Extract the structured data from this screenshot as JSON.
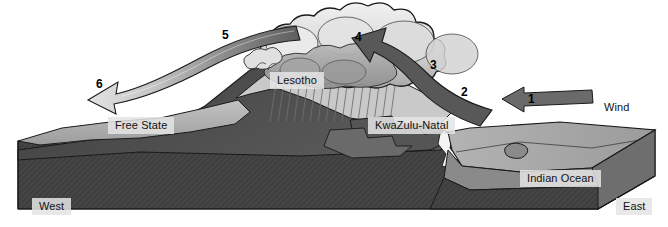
{
  "diagram": {
    "type": "cross-section-block-diagram"
  },
  "colors": {
    "cloud_light": "#e8e8e8",
    "cloud_mid": "#c8c8c8",
    "cloud_dark": "#9a9a9a",
    "arrow_dark": "#555555",
    "arrow_light": "#d9d9d9",
    "mountain_dark": "#4a4a4a",
    "mountain_mid": "#8d8d8d",
    "plateau_light": "#b4b4b4",
    "ocean": "#9f9f9f",
    "bedrock": "#3d3d3d",
    "outline": "#1a1a1a",
    "label_bg": "#e4e4e4"
  },
  "region_labels": [
    {
      "id": "lesotho",
      "text": "Lesotho",
      "x": 270,
      "y": 72,
      "chip": true
    },
    {
      "id": "free-state",
      "text": "Free State",
      "x": 108,
      "y": 117,
      "chip": true
    },
    {
      "id": "kwazulu-natal",
      "text": "KwaZulu-Natal",
      "x": 368,
      "y": 117,
      "chip": true
    },
    {
      "id": "indian-ocean",
      "text": "Indian Ocean",
      "x": 520,
      "y": 170,
      "chip": true
    },
    {
      "id": "west",
      "text": "West",
      "x": 32,
      "y": 198,
      "chip": true
    },
    {
      "id": "east",
      "text": "East",
      "x": 616,
      "y": 198,
      "chip": true
    },
    {
      "id": "wind",
      "text": "Wind",
      "x": 604,
      "y": 101,
      "chip": false
    }
  ],
  "step_numbers": [
    {
      "id": "step-1",
      "text": "1",
      "x": 528,
      "y": 93,
      "description": "Moist wind blows in from the Indian Ocean"
    },
    {
      "id": "step-2",
      "text": "2",
      "x": 461,
      "y": 86,
      "description": "Air is forced to rise up the escarpment"
    },
    {
      "id": "step-3",
      "text": "3",
      "x": 430,
      "y": 59,
      "description": "Air cools, condenses and forms cloud"
    },
    {
      "id": "step-4",
      "text": "4",
      "x": 355,
      "y": 31,
      "description": "Rain falls on the windward slope"
    },
    {
      "id": "step-5",
      "text": "5",
      "x": 222,
      "y": 29,
      "description": "Dry air descends on the leeward side"
    },
    {
      "id": "step-6",
      "text": "6",
      "x": 96,
      "y": 78,
      "description": "Warm dry air moves over the Free State"
    }
  ],
  "legend_notes": {
    "windward_side": "East",
    "leeward_side": "West",
    "rain_shadow": "Free State"
  }
}
